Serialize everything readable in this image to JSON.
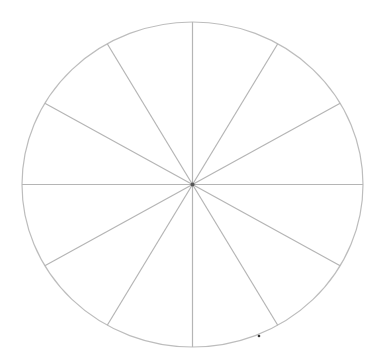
{
  "diagram": {
    "type": "segmented-circle",
    "segment_count": 12,
    "center": {
      "x": 192.5,
      "y": 184.5
    },
    "radius_x": 170.5,
    "radius_y": 162.5,
    "spoke_angle_step_deg": 30,
    "colors": {
      "background": "#ffffff",
      "outline": "#bdbdbd",
      "spoke": "#b5b5b5",
      "center_dot": "#555555",
      "stray_dot": "#333333"
    },
    "stray_dot": {
      "x": 259,
      "y": 336
    }
  }
}
